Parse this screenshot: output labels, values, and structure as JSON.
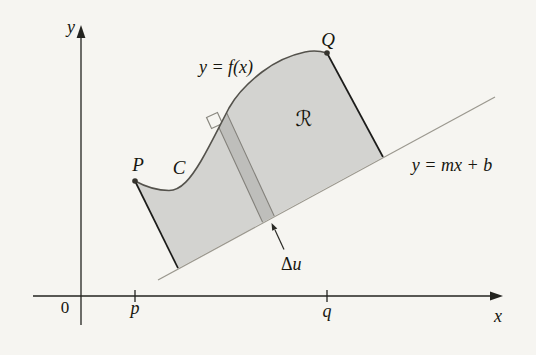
{
  "figure": {
    "description_labels": {
      "y_axis": "y",
      "x_axis": "x",
      "origin": "0",
      "p_tick": "p",
      "q_tick": "q",
      "curve_equation": "y = f(x)",
      "line_equation": "y = mx + b",
      "point_P": "P",
      "point_Q": "Q",
      "curve_name": "C",
      "region": "ℛ",
      "strip_delta": "Δ",
      "strip_var": "u"
    },
    "colors": {
      "background": "#f6f5f1",
      "region_fill": "#d3d3d0",
      "strip_fill": "#bebebb",
      "strip_edge": "#84827c",
      "curve_stroke": "#54524c",
      "edge_stroke": "#1c1c1a",
      "secant_line": "#9b988f",
      "axis": "#23231f",
      "text": "#17160f"
    }
  }
}
